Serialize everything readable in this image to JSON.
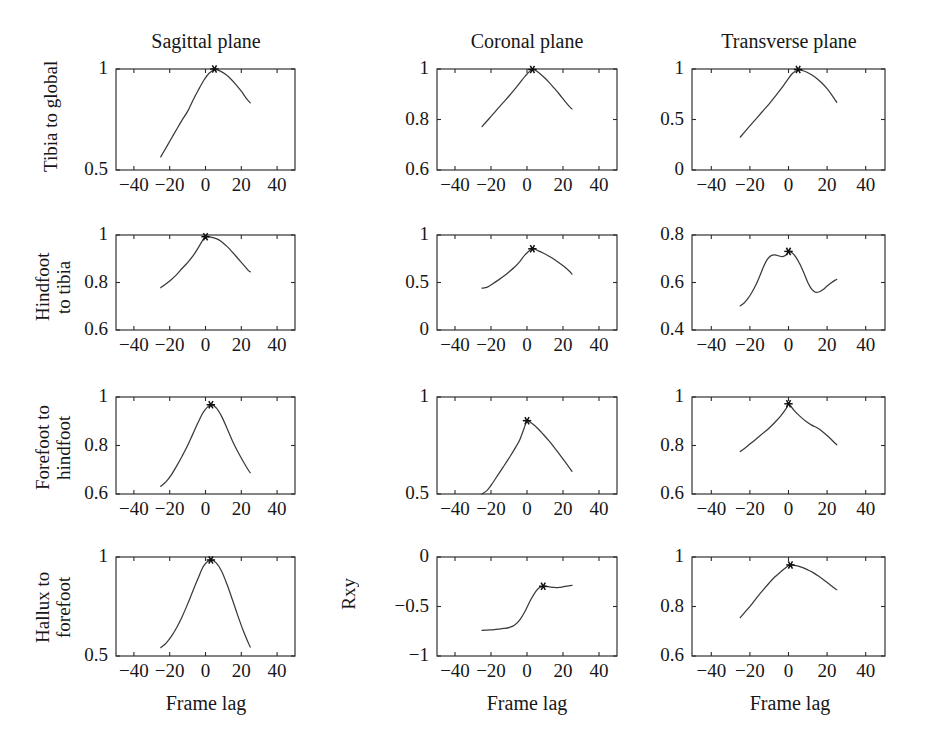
{
  "figure": {
    "column_titles": [
      "Sagittal plane",
      "Coronal plane",
      "Transverse plane"
    ],
    "row_labels": [
      "Tibia to global",
      "Hindfoot\nto tibia",
      "Forefoot to\nhindfoot",
      "Hallux to\nforefoot"
    ],
    "row_labels_flat": [
      "Tibia to global",
      "Hindfoot to tibia",
      "Forefoot to hindfoot",
      "Hallux to forefoot"
    ],
    "shared_ylabel": "Rxy",
    "shared_xlabel": "Frame lag",
    "xlabels": [
      "Frame lag",
      "Frame lag",
      "Frame lag"
    ],
    "curve_color": "#3a3a3a",
    "axis_color": "#2a2a2a",
    "background": "#ffffff"
  },
  "chart_data": [
    {
      "type": "line",
      "title": "Tibia to global — Sagittal plane",
      "row": "Tibia to global",
      "column": "Sagittal plane",
      "xlabel": "Frame lag",
      "ylabel": "Rxy",
      "xlim": [
        -50,
        50
      ],
      "ylim": [
        0.5,
        1
      ],
      "xticks": [
        -40,
        -20,
        0,
        20,
        40
      ],
      "xtick_labels": [
        "−40",
        "−20",
        "0",
        "20",
        "40"
      ],
      "yticks": [
        0.5,
        1
      ],
      "ytick_labels": [
        "0.5",
        "1"
      ],
      "grid": false,
      "peak": {
        "x": 5,
        "y": 1.0,
        "marker": "star"
      },
      "x": [
        -25,
        -22,
        -19,
        -16,
        -13,
        -10,
        -7,
        -4,
        -1,
        2,
        5,
        8,
        11,
        14,
        17,
        20,
        23,
        25
      ],
      "y": [
        0.565,
        0.611,
        0.657,
        0.703,
        0.748,
        0.79,
        0.845,
        0.896,
        0.943,
        0.979,
        0.996,
        0.991,
        0.975,
        0.952,
        0.923,
        0.89,
        0.852,
        0.833
      ]
    },
    {
      "type": "line",
      "title": "Tibia to global — Coronal plane",
      "row": "Tibia to global",
      "column": "Coronal plane",
      "xlabel": "Frame lag",
      "ylabel": "Rxy",
      "xlim": [
        -50,
        50
      ],
      "ylim": [
        0.6,
        1
      ],
      "xticks": [
        -40,
        -20,
        0,
        20,
        40
      ],
      "xtick_labels": [
        "−40",
        "−20",
        "0",
        "20",
        "40"
      ],
      "yticks": [
        0.6,
        0.8,
        1
      ],
      "ytick_labels": [
        "0.6",
        "0.8",
        "1"
      ],
      "grid": false,
      "peak": {
        "x": 3,
        "y": 0.998,
        "marker": "star"
      },
      "x": [
        -25,
        -22,
        -19,
        -16,
        -13,
        -10,
        -7,
        -4,
        -1,
        3,
        6,
        9,
        12,
        15,
        18,
        21,
        24,
        25
      ],
      "y": [
        0.772,
        0.796,
        0.82,
        0.845,
        0.869,
        0.893,
        0.918,
        0.945,
        0.972,
        0.998,
        0.988,
        0.97,
        0.949,
        0.925,
        0.9,
        0.873,
        0.848,
        0.842
      ]
    },
    {
      "type": "line",
      "title": "Tibia to global — Transverse plane",
      "row": "Tibia to global",
      "column": "Transverse plane",
      "xlabel": "Frame lag",
      "ylabel": "Rxy",
      "xlim": [
        -50,
        50
      ],
      "ylim": [
        0,
        1
      ],
      "xticks": [
        -40,
        -20,
        0,
        20,
        40
      ],
      "xtick_labels": [
        "−40",
        "−20",
        "0",
        "20",
        "40"
      ],
      "yticks": [
        0,
        0.5,
        1
      ],
      "ytick_labels": [
        "0",
        "0.5",
        "1"
      ],
      "grid": false,
      "peak": {
        "x": 5,
        "y": 0.995,
        "marker": "star"
      },
      "x": [
        -25,
        -22,
        -19,
        -16,
        -13,
        -10,
        -7,
        -4,
        -1,
        2,
        5,
        8,
        11,
        14,
        17,
        20,
        23,
        25
      ],
      "y": [
        0.325,
        0.393,
        0.459,
        0.524,
        0.59,
        0.655,
        0.727,
        0.8,
        0.879,
        0.955,
        0.99,
        0.98,
        0.953,
        0.916,
        0.866,
        0.805,
        0.727,
        0.67
      ]
    },
    {
      "type": "line",
      "title": "Hindfoot to tibia — Sagittal plane",
      "row": "Hindfoot to tibia",
      "column": "Sagittal plane",
      "xlabel": "Frame lag",
      "ylabel": "Rxy",
      "xlim": [
        -50,
        50
      ],
      "ylim": [
        0.6,
        1
      ],
      "xticks": [
        -40,
        -20,
        0,
        20,
        40
      ],
      "xtick_labels": [
        "−40",
        "−20",
        "0",
        "20",
        "40"
      ],
      "yticks": [
        0.6,
        0.8,
        1
      ],
      "ytick_labels": [
        "0.6",
        "0.8",
        "1"
      ],
      "grid": false,
      "peak": {
        "x": 0,
        "y": 0.993,
        "marker": "star"
      },
      "x": [
        -25,
        -22,
        -19,
        -16,
        -13,
        -10,
        -7,
        -4,
        -1,
        0,
        3,
        6,
        9,
        12,
        15,
        18,
        21,
        24,
        25
      ],
      "y": [
        0.778,
        0.795,
        0.813,
        0.834,
        0.86,
        0.884,
        0.912,
        0.947,
        0.985,
        0.993,
        0.991,
        0.985,
        0.972,
        0.952,
        0.928,
        0.902,
        0.876,
        0.85,
        0.845
      ]
    },
    {
      "type": "line",
      "title": "Hindfoot to tibia — Coronal plane",
      "row": "Hindfoot to tibia",
      "column": "Coronal plane",
      "xlabel": "Frame lag",
      "ylabel": "Rxy",
      "xlim": [
        -50,
        50
      ],
      "ylim": [
        0,
        1
      ],
      "xticks": [
        -40,
        -20,
        0,
        20,
        40
      ],
      "xtick_labels": [
        "−40",
        "−20",
        "0",
        "20",
        "40"
      ],
      "yticks": [
        0,
        0.5,
        1
      ],
      "ytick_labels": [
        "0",
        "0.5",
        "1"
      ],
      "grid": false,
      "peak": {
        "x": 3,
        "y": 0.855,
        "marker": "star"
      },
      "x": [
        -25,
        -22,
        -19,
        -16,
        -13,
        -10,
        -7,
        -4,
        -1,
        3,
        6,
        9,
        12,
        15,
        18,
        21,
        24,
        25
      ],
      "y": [
        0.44,
        0.452,
        0.487,
        0.525,
        0.565,
        0.611,
        0.66,
        0.72,
        0.793,
        0.855,
        0.836,
        0.81,
        0.779,
        0.745,
        0.705,
        0.663,
        0.61,
        0.588
      ]
    },
    {
      "type": "line",
      "title": "Hindfoot to tibia — Transverse plane",
      "row": "Hindfoot to tibia",
      "column": "Transverse plane",
      "xlabel": "Frame lag",
      "ylabel": "Rxy",
      "xlim": [
        -50,
        50
      ],
      "ylim": [
        0.4,
        0.8
      ],
      "xticks": [
        -40,
        -20,
        0,
        20,
        40
      ],
      "xtick_labels": [
        "−40",
        "−20",
        "0",
        "20",
        "40"
      ],
      "yticks": [
        0.4,
        0.6,
        0.8
      ],
      "ytick_labels": [
        "0.4",
        "0.6",
        "0.8"
      ],
      "grid": false,
      "peak": {
        "x": 0,
        "y": 0.731,
        "marker": "star"
      },
      "x": [
        -25,
        -23,
        -21,
        -19,
        -17,
        -15,
        -13,
        -11,
        -9,
        -7,
        -5,
        -3,
        -1,
        0,
        2,
        4,
        6,
        8,
        10,
        12,
        14,
        16,
        18,
        20,
        22,
        24,
        25
      ],
      "y": [
        0.502,
        0.514,
        0.533,
        0.558,
        0.588,
        0.625,
        0.665,
        0.697,
        0.713,
        0.716,
        0.712,
        0.709,
        0.718,
        0.731,
        0.724,
        0.705,
        0.676,
        0.64,
        0.6,
        0.572,
        0.559,
        0.561,
        0.571,
        0.585,
        0.598,
        0.609,
        0.613
      ]
    },
    {
      "type": "line",
      "title": "Forefoot to hindfoot — Sagittal plane",
      "row": "Forefoot to hindfoot",
      "column": "Sagittal plane",
      "xlabel": "Frame lag",
      "ylabel": "Rxy",
      "xlim": [
        -50,
        50
      ],
      "ylim": [
        0.6,
        1
      ],
      "xticks": [
        -40,
        -20,
        0,
        20,
        40
      ],
      "xtick_labels": [
        "−40",
        "−20",
        "0",
        "20",
        "40"
      ],
      "yticks": [
        0.6,
        0.8,
        1
      ],
      "ytick_labels": [
        "0.6",
        "0.8",
        "1"
      ],
      "grid": false,
      "peak": {
        "x": 3,
        "y": 0.968,
        "marker": "star"
      },
      "x": [
        -25,
        -22,
        -19,
        -16,
        -13,
        -10,
        -7,
        -4,
        -1,
        3,
        6,
        9,
        12,
        15,
        18,
        21,
        24,
        25
      ],
      "y": [
        0.632,
        0.651,
        0.68,
        0.717,
        0.757,
        0.8,
        0.849,
        0.897,
        0.94,
        0.968,
        0.955,
        0.92,
        0.871,
        0.82,
        0.775,
        0.735,
        0.698,
        0.688
      ]
    },
    {
      "type": "line",
      "title": "Forefoot to hindfoot — Coronal plane",
      "row": "Forefoot to hindfoot",
      "column": "Coronal plane",
      "xlabel": "Frame lag",
      "ylabel": "Rxy",
      "xlim": [
        -50,
        50
      ],
      "ylim": [
        0.5,
        1
      ],
      "xticks": [
        -40,
        -20,
        0,
        20,
        40
      ],
      "xtick_labels": [
        "−40",
        "−20",
        "0",
        "20",
        "40"
      ],
      "yticks": [
        0.5,
        1
      ],
      "ytick_labels": [
        "0.5",
        "1"
      ],
      "grid": false,
      "peak": {
        "x": 0,
        "y": 0.878,
        "marker": "star"
      },
      "x": [
        -25,
        -22,
        -19,
        -16,
        -13,
        -10,
        -7,
        -4,
        -1,
        0,
        3,
        6,
        9,
        12,
        15,
        18,
        21,
        24,
        25
      ],
      "y": [
        0.5,
        0.52,
        0.558,
        0.6,
        0.642,
        0.685,
        0.73,
        0.78,
        0.855,
        0.878,
        0.862,
        0.838,
        0.808,
        0.776,
        0.742,
        0.705,
        0.668,
        0.63,
        0.617
      ]
    },
    {
      "type": "line",
      "title": "Forefoot to hindfoot — Transverse plane",
      "row": "Forefoot to hindfoot",
      "column": "Transverse plane",
      "xlabel": "Frame lag",
      "ylabel": "Rxy",
      "xlim": [
        -50,
        50
      ],
      "ylim": [
        0.6,
        1
      ],
      "xticks": [
        -40,
        -20,
        0,
        20,
        40
      ],
      "xtick_labels": [
        "−40",
        "−20",
        "0",
        "20",
        "40"
      ],
      "yticks": [
        0.6,
        0.8,
        1
      ],
      "ytick_labels": [
        "0.6",
        "0.8",
        "1"
      ],
      "grid": false,
      "peak": {
        "x": 0,
        "y": 0.972,
        "marker": "star"
      },
      "x": [
        -25,
        -22,
        -19,
        -16,
        -13,
        -10,
        -7,
        -4,
        -1,
        0,
        3,
        6,
        9,
        12,
        15,
        18,
        21,
        24,
        25
      ],
      "y": [
        0.775,
        0.793,
        0.812,
        0.832,
        0.852,
        0.872,
        0.896,
        0.922,
        0.955,
        0.972,
        0.944,
        0.92,
        0.9,
        0.884,
        0.872,
        0.855,
        0.834,
        0.81,
        0.803
      ]
    },
    {
      "type": "line",
      "title": "Hallux to forefoot — Sagittal plane",
      "row": "Hallux to forefoot",
      "column": "Sagittal plane",
      "xlabel": "Frame lag",
      "ylabel": "Rxy",
      "xlim": [
        -50,
        50
      ],
      "ylim": [
        0.5,
        1
      ],
      "xticks": [
        -40,
        -20,
        0,
        20,
        40
      ],
      "xtick_labels": [
        "−40",
        "−20",
        "0",
        "20",
        "40"
      ],
      "yticks": [
        0.5,
        1
      ],
      "ytick_labels": [
        "0.5",
        "1"
      ],
      "grid": false,
      "peak": {
        "x": 3,
        "y": 0.985,
        "marker": "star"
      },
      "x": [
        -25,
        -22,
        -19,
        -16,
        -13,
        -10,
        -7,
        -4,
        -1,
        3,
        6,
        9,
        12,
        15,
        18,
        21,
        24,
        25
      ],
      "y": [
        0.542,
        0.565,
        0.6,
        0.645,
        0.7,
        0.762,
        0.83,
        0.895,
        0.955,
        0.985,
        0.97,
        0.928,
        0.862,
        0.785,
        0.705,
        0.63,
        0.565,
        0.545
      ]
    },
    {
      "type": "line",
      "title": "Hallux to forefoot — Coronal plane",
      "row": "Hallux to forefoot",
      "column": "Coronal plane",
      "xlabel": "Frame lag",
      "ylabel": "Rxy",
      "xlim": [
        -50,
        50
      ],
      "ylim": [
        -1,
        0
      ],
      "xticks": [
        -40,
        -20,
        0,
        20,
        40
      ],
      "xtick_labels": [
        "−40",
        "−20",
        "0",
        "20",
        "40"
      ],
      "yticks": [
        -1,
        -0.5,
        0
      ],
      "ytick_labels": [
        "−1",
        "−0.5",
        "0"
      ],
      "grid": false,
      "peak": {
        "x": 9,
        "y": -0.296,
        "marker": "star"
      },
      "x": [
        -25,
        -22,
        -19,
        -16,
        -13,
        -10,
        -7,
        -4,
        -1,
        2,
        5,
        7,
        9,
        12,
        15,
        18,
        21,
        24,
        25
      ],
      "y": [
        -0.742,
        -0.738,
        -0.735,
        -0.728,
        -0.722,
        -0.713,
        -0.69,
        -0.635,
        -0.545,
        -0.435,
        -0.345,
        -0.308,
        -0.296,
        -0.3,
        -0.308,
        -0.307,
        -0.296,
        -0.288,
        -0.287
      ]
    },
    {
      "type": "line",
      "title": "Hallux to forefoot — Transverse plane",
      "row": "Hallux to forefoot",
      "column": "Transverse plane",
      "xlabel": "Frame lag",
      "ylabel": "Rxy",
      "xlim": [
        -50,
        50
      ],
      "ylim": [
        0.6,
        1
      ],
      "xticks": [
        -40,
        -20,
        0,
        20,
        40
      ],
      "xtick_labels": [
        "−40",
        "−20",
        "0",
        "20",
        "40"
      ],
      "yticks": [
        0.6,
        0.8,
        1
      ],
      "ytick_labels": [
        "0.6",
        "0.8",
        "1"
      ],
      "grid": false,
      "peak": {
        "x": 1,
        "y": 0.968,
        "marker": "star"
      },
      "x": [
        -25,
        -22,
        -19,
        -16,
        -13,
        -10,
        -7,
        -4,
        -1,
        1,
        4,
        7,
        10,
        13,
        16,
        19,
        22,
        24,
        25
      ],
      "y": [
        0.755,
        0.782,
        0.81,
        0.84,
        0.868,
        0.895,
        0.92,
        0.94,
        0.96,
        0.968,
        0.965,
        0.958,
        0.948,
        0.936,
        0.92,
        0.903,
        0.885,
        0.873,
        0.868
      ]
    }
  ]
}
